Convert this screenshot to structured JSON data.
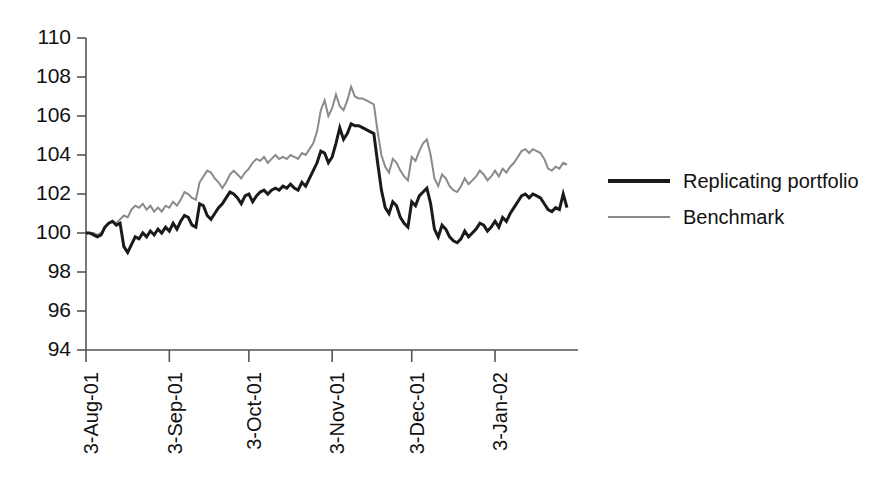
{
  "chart_data": {
    "type": "line",
    "title": "",
    "xlabel": "",
    "ylabel": "",
    "ylim": [
      94,
      110
    ],
    "yticks": [
      94,
      96,
      98,
      100,
      102,
      104,
      106,
      108,
      110
    ],
    "ytick_labels": [
      "94",
      "96",
      "98",
      "100",
      "102",
      "104",
      "106",
      "108",
      "110"
    ],
    "grid": false,
    "legend_position": "right",
    "xtick_labels": [
      "3-Aug-01",
      "3-Sep-01",
      "3-Oct-01",
      "3-Nov-01",
      "3-Dec-01",
      "3-Jan-02"
    ],
    "xtick_index": [
      0,
      22,
      43,
      65,
      86,
      108
    ],
    "x_count": 128,
    "series": [
      {
        "name": "Replicating portfolio",
        "color": "#1a1a1a",
        "width": 3.0,
        "values": [
          100.0,
          100.0,
          99.9,
          99.8,
          99.9,
          100.3,
          100.5,
          100.6,
          100.4,
          100.5,
          99.3,
          99.0,
          99.4,
          99.8,
          99.7,
          100.0,
          99.8,
          100.1,
          99.9,
          100.2,
          100.0,
          100.3,
          100.1,
          100.5,
          100.2,
          100.6,
          100.9,
          100.8,
          100.4,
          100.3,
          101.5,
          101.4,
          100.9,
          100.7,
          101.0,
          101.3,
          101.5,
          101.8,
          102.1,
          102.0,
          101.8,
          101.5,
          101.9,
          102.0,
          101.6,
          101.9,
          102.1,
          102.2,
          102.0,
          102.2,
          102.3,
          102.2,
          102.4,
          102.3,
          102.5,
          102.3,
          102.2,
          102.6,
          102.4,
          102.8,
          103.2,
          103.6,
          104.2,
          104.1,
          103.6,
          103.9,
          104.6,
          105.4,
          104.8,
          105.1,
          105.6,
          105.5,
          105.5,
          105.4,
          105.3,
          105.2,
          105.1,
          103.6,
          102.2,
          101.3,
          101.0,
          101.6,
          101.4,
          100.8,
          100.5,
          100.3,
          101.6,
          101.4,
          101.9,
          102.1,
          102.3,
          101.5,
          100.2,
          99.8,
          100.4,
          100.2,
          99.8,
          99.6,
          99.5,
          99.7,
          100.1,
          99.8,
          100.0,
          100.2,
          100.5,
          100.4,
          100.1,
          100.3,
          100.6,
          100.3,
          100.8,
          100.6,
          101.0,
          101.3,
          101.6,
          101.9,
          102.0,
          101.8,
          102.0,
          101.9,
          101.8,
          101.5,
          101.2,
          101.1,
          101.3,
          101.2,
          102.0,
          101.3
        ]
      },
      {
        "name": "Benchmark",
        "color": "#8a8a8a",
        "width": 2.0,
        "values": [
          100.0,
          100.0,
          100.0,
          99.9,
          100.0,
          100.3,
          100.5,
          100.6,
          100.5,
          100.7,
          100.9,
          100.8,
          101.2,
          101.4,
          101.3,
          101.5,
          101.2,
          101.4,
          101.1,
          101.3,
          101.1,
          101.4,
          101.3,
          101.6,
          101.4,
          101.7,
          102.1,
          102.0,
          101.8,
          101.7,
          102.6,
          102.9,
          103.2,
          103.1,
          102.8,
          102.6,
          102.3,
          102.6,
          103.0,
          103.2,
          103.0,
          102.8,
          103.1,
          103.3,
          103.6,
          103.8,
          103.7,
          103.9,
          103.6,
          103.8,
          104.0,
          103.8,
          103.9,
          103.8,
          104.0,
          103.9,
          103.8,
          104.1,
          104.0,
          104.3,
          104.6,
          105.2,
          106.3,
          106.8,
          106.0,
          106.4,
          107.1,
          106.5,
          106.3,
          106.8,
          107.5,
          107.0,
          106.9,
          106.9,
          106.8,
          106.7,
          106.6,
          105.2,
          104.0,
          103.4,
          103.1,
          103.8,
          103.6,
          103.2,
          102.9,
          102.7,
          103.9,
          103.7,
          104.2,
          104.6,
          104.8,
          104.0,
          102.8,
          102.4,
          103.0,
          102.8,
          102.4,
          102.2,
          102.1,
          102.4,
          102.8,
          102.5,
          102.7,
          102.9,
          103.2,
          103.0,
          102.7,
          102.9,
          103.2,
          102.9,
          103.3,
          103.1,
          103.4,
          103.6,
          103.9,
          104.2,
          104.3,
          104.1,
          104.3,
          104.2,
          104.1,
          103.8,
          103.3,
          103.2,
          103.4,
          103.3,
          103.6,
          103.5
        ]
      }
    ]
  }
}
